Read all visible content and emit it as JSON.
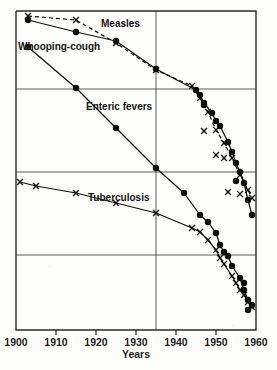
{
  "figure": {
    "background_color": "#fdfdfb",
    "ink_color": "#111111",
    "grid_color": "#4a4a4a"
  },
  "axis": {
    "x_title": "Years",
    "x_ticks": [
      "1900",
      "1910",
      "1920",
      "1930",
      "1940",
      "1950",
      "1960"
    ],
    "x_tick_values": [
      1900,
      1910,
      1920,
      1930,
      1940,
      1950,
      1960
    ],
    "y_ticks": [],
    "vertical_marker_year": 1935
  },
  "series_labels": {
    "measles": "Measles",
    "whooping_cough": "Whooping-cough",
    "enteric_fevers": "Enteric fevers",
    "tuberculosis": "Tuberculosis"
  },
  "chart_data": {
    "type": "line",
    "title": "",
    "subtitle": "",
    "xlabel": "Years",
    "ylabel": "",
    "xlim": [
      1900,
      1960
    ],
    "ylim_pixels": [
      11,
      330
    ],
    "grid": true,
    "grid_orientation": "both",
    "gridlines_horizontal_pixels": [
      89,
      172,
      255
    ],
    "gridline_vertical_years": [
      1935
    ],
    "legend": "inline-labels",
    "legend_position": "inline",
    "scale_note": "semi-logarithmic decline of standardised death rates",
    "series": [
      {
        "name": "Measles",
        "marker": "cross",
        "line_style": "dashed",
        "points": [
          {
            "x": 1903,
            "y_px": 16
          },
          {
            "x": 1915,
            "y_px": 20
          },
          {
            "x": 1925,
            "y_px": 43
          },
          {
            "x": 1935,
            "y_px": 70
          },
          {
            "x": 1944,
            "y_px": 86
          },
          {
            "x": 1946,
            "y_px": 98
          },
          {
            "x": 1948,
            "y_px": 112
          },
          {
            "x": 1950,
            "y_px": 130
          },
          {
            "x": 1952,
            "y_px": 143
          },
          {
            "x": 1954,
            "y_px": 158
          },
          {
            "x": 1956,
            "y_px": 175
          },
          {
            "x": 1958,
            "y_px": 190
          },
          {
            "x": 1959,
            "y_px": 198
          }
        ]
      },
      {
        "name": "Whooping-cough",
        "marker": "dot",
        "line_style": "solid",
        "points": [
          {
            "x": 1903,
            "y_px": 20
          },
          {
            "x": 1915,
            "y_px": 32
          },
          {
            "x": 1925,
            "y_px": 41
          },
          {
            "x": 1935,
            "y_px": 69
          },
          {
            "x": 1945,
            "y_px": 90
          },
          {
            "x": 1946,
            "y_px": 95
          },
          {
            "x": 1947,
            "y_px": 103
          },
          {
            "x": 1949,
            "y_px": 113
          },
          {
            "x": 1950,
            "y_px": 121
          },
          {
            "x": 1951,
            "y_px": 126
          },
          {
            "x": 1953,
            "y_px": 142
          },
          {
            "x": 1954,
            "y_px": 152
          },
          {
            "x": 1955,
            "y_px": 163
          },
          {
            "x": 1956,
            "y_px": 172
          },
          {
            "x": 1957,
            "y_px": 183
          },
          {
            "x": 1958,
            "y_px": 200
          },
          {
            "x": 1959,
            "y_px": 215
          }
        ]
      },
      {
        "name": "Enteric fevers",
        "marker": "dot",
        "line_style": "solid",
        "points": [
          {
            "x": 1903,
            "y_px": 47
          },
          {
            "x": 1915,
            "y_px": 88
          },
          {
            "x": 1925,
            "y_px": 128
          },
          {
            "x": 1935,
            "y_px": 168
          },
          {
            "x": 1942,
            "y_px": 193
          },
          {
            "x": 1946,
            "y_px": 215
          },
          {
            "x": 1948,
            "y_px": 222
          },
          {
            "x": 1950,
            "y_px": 233
          },
          {
            "x": 1951,
            "y_px": 245
          },
          {
            "x": 1952,
            "y_px": 252
          },
          {
            "x": 1953,
            "y_px": 256
          },
          {
            "x": 1954,
            "y_px": 266
          },
          {
            "x": 1956,
            "y_px": 278
          },
          {
            "x": 1957,
            "y_px": 290
          },
          {
            "x": 1958,
            "y_px": 300
          },
          {
            "x": 1959,
            "y_px": 305
          }
        ]
      },
      {
        "name": "Tuberculosis",
        "marker": "cross",
        "line_style": "solid",
        "points": [
          {
            "x": 1901,
            "y_px": 182
          },
          {
            "x": 1905,
            "y_px": 186
          },
          {
            "x": 1915,
            "y_px": 193
          },
          {
            "x": 1925,
            "y_px": 203
          },
          {
            "x": 1935,
            "y_px": 213
          },
          {
            "x": 1944,
            "y_px": 228
          },
          {
            "x": 1946,
            "y_px": 232
          },
          {
            "x": 1948,
            "y_px": 240
          },
          {
            "x": 1950,
            "y_px": 250
          },
          {
            "x": 1951,
            "y_px": 258
          },
          {
            "x": 1952,
            "y_px": 264
          },
          {
            "x": 1954,
            "y_px": 276
          },
          {
            "x": 1955,
            "y_px": 283
          },
          {
            "x": 1956,
            "y_px": 290
          },
          {
            "x": 1957,
            "y_px": 295
          },
          {
            "x": 1958,
            "y_px": 302
          },
          {
            "x": 1959,
            "y_px": 307
          }
        ]
      }
    ],
    "scatter_outliers": [
      {
        "series": "Measles",
        "x": 1947,
        "y_px": 131,
        "marker": "cross"
      },
      {
        "series": "Measles",
        "x": 1950,
        "y_px": 155,
        "marker": "cross"
      },
      {
        "series": "Measles",
        "x": 1952,
        "y_px": 158,
        "marker": "cross"
      },
      {
        "series": "Measles",
        "x": 1953,
        "y_px": 192,
        "marker": "cross"
      },
      {
        "series": "Measles",
        "x": 1956,
        "y_px": 194,
        "marker": "cross"
      },
      {
        "series": "Whooping-cough",
        "x": 1947,
        "y_px": 105,
        "marker": "dot"
      },
      {
        "series": "Whooping-cough",
        "x": 1955,
        "y_px": 181,
        "marker": "dot"
      },
      {
        "series": "Enteric fevers",
        "x": 1957,
        "y_px": 283,
        "marker": "dot"
      },
      {
        "series": "Enteric fevers",
        "x": 1958,
        "y_px": 310,
        "marker": "dot"
      }
    ]
  }
}
